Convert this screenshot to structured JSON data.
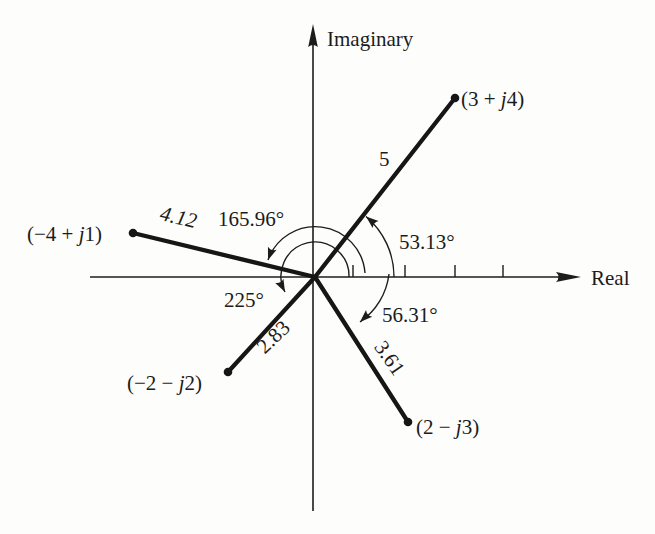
{
  "figure": {
    "type": "complex-plane-vector-diagram",
    "axes": {
      "imaginary": "Imaginary",
      "real": "Real"
    },
    "colors": {
      "ink": "#1c1c1c",
      "paper": "#fdfdfb"
    },
    "vectors": [
      {
        "re": 3,
        "im": 4,
        "label": {
          "pre": "(3 + ",
          "j": "j",
          "post": "4)"
        },
        "magnitude": "5",
        "angle": "53.13°"
      },
      {
        "re": -4,
        "im": 1,
        "label": {
          "pre": "(−4 + ",
          "j": "j",
          "post": "1)"
        },
        "magnitude": "4.12",
        "angle": "165.96°"
      },
      {
        "re": -2,
        "im": -2,
        "label": {
          "pre": "(−2 − ",
          "j": "j",
          "post": "2)"
        },
        "magnitude": "2.83",
        "angle": "225°"
      },
      {
        "re": 2,
        "im": -3,
        "label": {
          "pre": "(2 − ",
          "j": "j",
          "post": "3)"
        },
        "magnitude": "3.61",
        "angle": "56.31°"
      }
    ],
    "real_axis_tick_count": "4"
  }
}
